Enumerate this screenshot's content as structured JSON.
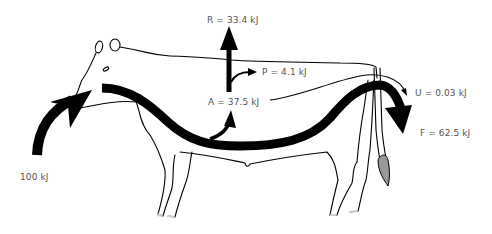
{
  "diagram": {
    "labels": {
      "input": "100 kJ",
      "respiration": "R = 33.4 kJ",
      "production": "P = 4.1 kJ",
      "assimilation": "A = 37.5 kJ",
      "urine": "U = 0.03 kJ",
      "feces": "F = 62.5 kJ"
    },
    "colors": {
      "arrow": "#000000",
      "outline": "#000000",
      "text": "#555555",
      "tail_tuft": "#999999"
    }
  }
}
